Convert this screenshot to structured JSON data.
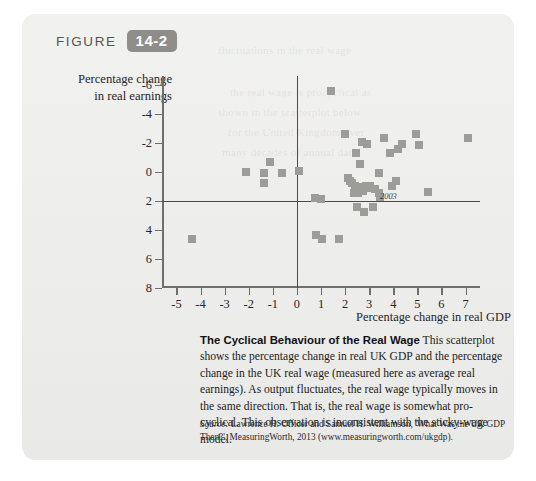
{
  "figure": {
    "label": "FIGURE",
    "number": "14-2",
    "badge_color": "#8e8d89"
  },
  "axes": {
    "y_title_line1": "Percentage change",
    "y_title_line2": "in real earnings",
    "x_title": "Percentage change in real GDP",
    "y_ticks": [
      "8",
      "6",
      "4",
      "2",
      "0",
      "-2",
      "-4",
      "-6"
    ],
    "x_ticks": [
      "-5",
      "-4",
      "-3",
      "-2",
      "-1",
      "0",
      "1",
      "2",
      "3",
      "4",
      "5",
      "6",
      "7"
    ]
  },
  "annotations": [
    {
      "text": "2003",
      "x": 3.45,
      "y": 0.35
    }
  ],
  "caption": {
    "title": "The Cyclical Behaviour of the Real Wage",
    "body": "This scatterplot shows the percentage change in real UK GDP and the percentage change in the UK real wage (measured here as average real earnings). As output fluctuates, the real wage typically moves in the same direction. That is, the real wage is somewhat pro-cyclical. This observation is inconsistent with the sticky-wage model."
  },
  "source": {
    "label": "Source:",
    "text": " Lawrence H. Officer and Samuel H. Williamson, 'What Was the UK GDP Then?', MeasuringWorth, 2013 (www.measuringworth.com/ukgdp)."
  },
  "chart_data": {
    "type": "scatter",
    "title": "The Cyclical Behaviour of the Real Wage",
    "xlabel": "Percentage change in real GDP",
    "ylabel": "Percentage change in real earnings",
    "xlim": [
      -5.6,
      7.6
    ],
    "ylim": [
      -6,
      8.6
    ],
    "xticks": [
      -5,
      -4,
      -3,
      -2,
      -1,
      0,
      1,
      2,
      3,
      4,
      5,
      6,
      7
    ],
    "yticks": [
      -6,
      -4,
      -2,
      0,
      2,
      4,
      6,
      8
    ],
    "grid": false,
    "legend": null,
    "marker": "square",
    "marker_color": "#9c9c99",
    "points": [
      {
        "x": -4.35,
        "y": -2.6
      },
      {
        "x": -2.1,
        "y": 2.0
      },
      {
        "x": -1.35,
        "y": 1.9
      },
      {
        "x": -1.35,
        "y": 1.25
      },
      {
        "x": -1.1,
        "y": 2.65
      },
      {
        "x": -0.6,
        "y": 1.95
      },
      {
        "x": 0.1,
        "y": 2.05
      },
      {
        "x": 0.75,
        "y": 0.2
      },
      {
        "x": 0.8,
        "y": -2.35
      },
      {
        "x": 1.0,
        "y": 0.1
      },
      {
        "x": 1.05,
        "y": -2.65
      },
      {
        "x": 1.4,
        "y": 7.6
      },
      {
        "x": 1.75,
        "y": -2.6
      },
      {
        "x": 2.0,
        "y": 4.6
      },
      {
        "x": 2.1,
        "y": 1.55
      },
      {
        "x": 2.2,
        "y": 1.35
      },
      {
        "x": 2.3,
        "y": 1.2
      },
      {
        "x": 2.35,
        "y": 0.55
      },
      {
        "x": 2.4,
        "y": 1.0
      },
      {
        "x": 2.45,
        "y": 3.3
      },
      {
        "x": 2.5,
        "y": 0.8
      },
      {
        "x": 2.5,
        "y": -0.45
      },
      {
        "x": 2.55,
        "y": 0.55
      },
      {
        "x": 2.6,
        "y": 2.55
      },
      {
        "x": 2.65,
        "y": 0.95
      },
      {
        "x": 2.7,
        "y": 4.05
      },
      {
        "x": 2.75,
        "y": 0.65
      },
      {
        "x": 2.8,
        "y": -0.8
      },
      {
        "x": 2.85,
        "y": 1.0
      },
      {
        "x": 2.9,
        "y": 3.9
      },
      {
        "x": 2.95,
        "y": 0.9
      },
      {
        "x": 3.05,
        "y": 1.0
      },
      {
        "x": 3.15,
        "y": -0.45
      },
      {
        "x": 3.25,
        "y": 0.85
      },
      {
        "x": 3.4,
        "y": 0.55
      },
      {
        "x": 3.4,
        "y": 1.9
      },
      {
        "x": 3.45,
        "y": 0.25
      },
      {
        "x": 3.6,
        "y": 4.3
      },
      {
        "x": 3.85,
        "y": 3.3
      },
      {
        "x": 3.95,
        "y": 1.05
      },
      {
        "x": 4.1,
        "y": 1.4
      },
      {
        "x": 4.2,
        "y": 3.55
      },
      {
        "x": 4.35,
        "y": 3.9
      },
      {
        "x": 4.95,
        "y": 4.6
      },
      {
        "x": 5.05,
        "y": 3.85
      },
      {
        "x": 5.45,
        "y": 0.6
      },
      {
        "x": 7.1,
        "y": 4.3
      }
    ]
  }
}
